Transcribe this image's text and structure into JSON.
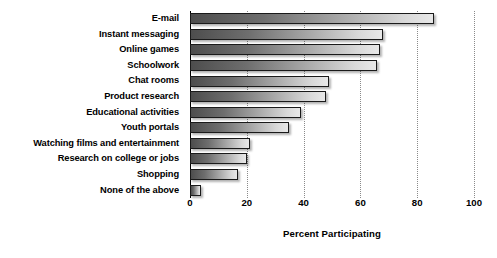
{
  "chart_data": {
    "type": "bar",
    "orientation": "horizontal",
    "title": "",
    "xlabel": "Percent Participating",
    "ylabel": "",
    "xlim": [
      0,
      100
    ],
    "xticks": [
      0,
      20,
      40,
      60,
      80,
      100
    ],
    "grid": true,
    "legend": null,
    "categories": [
      "E-mail",
      "Instant messaging",
      "Online games",
      "Schoolwork",
      "Chat rooms",
      "Product research",
      "Educational activities",
      "Youth portals",
      "Watching films and entertainment",
      "Research on college or jobs",
      "Shopping",
      "None of the above"
    ],
    "values": [
      86,
      68,
      67,
      66,
      49,
      48,
      39,
      35,
      21,
      20,
      17,
      4
    ]
  },
  "colors": {
    "bar_gradient_start": "#4d4d4d",
    "bar_gradient_end": "#e8e8e8",
    "bar_border": "#1a1a1a",
    "gridline": "#8a8a8a",
    "axis": "#000000",
    "text": "#000000",
    "background": "#ffffff"
  }
}
